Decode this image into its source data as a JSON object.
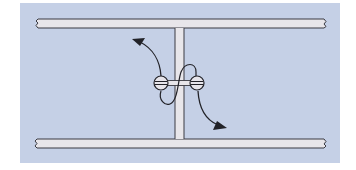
{
  "diagram": {
    "type": "technical-illustration",
    "colors": {
      "page": "#ffffff",
      "panel": "#c5d0e6",
      "bar_fill": "#e8e6ea",
      "stroke": "#2a2a30",
      "screw_fill": "#e6e4ea"
    },
    "elements": {
      "top_bar": "horizontal-bar",
      "bottom_bar": "horizontal-bar",
      "stem": "vertical-stem",
      "left_screw": "screw-icon",
      "right_screw": "screw-icon",
      "left_arrow": "curved-arrow-up-left",
      "right_arrow": "curved-arrow-down-right"
    }
  }
}
